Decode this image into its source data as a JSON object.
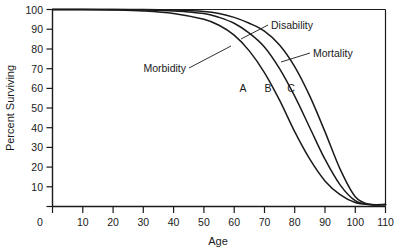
{
  "chart_data": {
    "type": "line",
    "title": "",
    "xlabel": "Age",
    "ylabel": "Percent Surviving",
    "xlim": [
      0,
      110
    ],
    "ylim": [
      0,
      100
    ],
    "xticks": [
      0,
      10,
      20,
      30,
      40,
      50,
      60,
      70,
      80,
      90,
      100,
      110
    ],
    "yticks": [
      0,
      10,
      20,
      30,
      40,
      50,
      60,
      70,
      80,
      90,
      100
    ],
    "ytick_labels": [
      "",
      "10",
      "20",
      "30",
      "40",
      "50",
      "60",
      "70",
      "80",
      "90",
      "100"
    ],
    "grid": false,
    "legend": "none",
    "x": [
      0,
      10,
      20,
      30,
      40,
      50,
      55,
      60,
      65,
      70,
      75,
      80,
      85,
      90,
      95,
      100,
      105,
      110
    ],
    "series": [
      {
        "name": "A",
        "annotation": "Morbidity",
        "values": [
          100,
          100,
          99.8,
          99.3,
          98,
          95,
          92,
          87,
          79,
          68,
          54,
          38,
          24,
          13,
          6,
          2,
          1,
          1
        ]
      },
      {
        "name": "B",
        "annotation": "Disability",
        "values": [
          100,
          100,
          100,
          99.8,
          99.3,
          98,
          96,
          93,
          88,
          81,
          70,
          56,
          40,
          24,
          11,
          3,
          1,
          1
        ]
      },
      {
        "name": "C",
        "annotation": "Mortality",
        "values": [
          100,
          100,
          100,
          100,
          99.7,
          99,
          98,
          96,
          93,
          89,
          82,
          71,
          56,
          38,
          19,
          5,
          1,
          1
        ]
      }
    ],
    "annotations": [
      {
        "label": "Morbidity",
        "points_to": "A"
      },
      {
        "label": "Disability",
        "points_to": "B"
      },
      {
        "label": "Mortality",
        "points_to": "C"
      }
    ],
    "curve_labels": [
      "A",
      "B",
      "C"
    ],
    "colors": {
      "line": "#1a1a1a",
      "axis": "#1a1a1a",
      "background": "#ffffff"
    }
  }
}
